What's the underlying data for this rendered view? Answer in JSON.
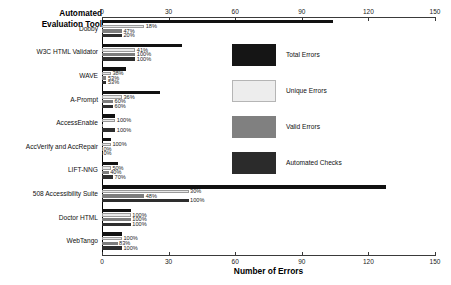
{
  "chart_data": {
    "type": "bar",
    "orientation": "horizontal",
    "title": "",
    "axis_title": "Automated Evaluation Tool",
    "xlabel": "Number of Errors",
    "ylabel": "Automated Evaluation Tool",
    "xlim": [
      0,
      150
    ],
    "xticks": [
      0,
      30,
      60,
      90,
      120,
      150
    ],
    "grid": false,
    "legend_position": "inside-right",
    "categories": [
      "Dobby",
      "W3C HTML Validator",
      "WAVE",
      "A-Prompt",
      "AccessEnable",
      "AccVerify and AccRepair",
      "LIFT-NNG",
      "508 Accessibility Suite",
      "Doctor HTML",
      "WebTango"
    ],
    "series": [
      {
        "name": "Total Errors",
        "color": "#111111",
        "values": [
          104,
          36,
          11,
          26,
          6,
          4,
          7,
          128,
          13,
          9
        ]
      },
      {
        "name": "Unique Errors",
        "color": "#e8e8e8",
        "values": [
          19,
          15,
          4,
          9,
          6,
          4,
          4,
          39,
          13,
          9
        ]
      },
      {
        "name": "Valid Errors",
        "color": "#7d7d7d",
        "values": [
          9,
          15,
          2,
          5,
          0,
          0,
          3,
          19,
          13,
          7
        ]
      },
      {
        "name": "Automated Checks",
        "color": "#2e2e2e",
        "values": [
          9,
          15,
          2,
          5,
          6,
          0,
          5,
          39,
          13,
          9
        ]
      }
    ],
    "data_labels": {
      "Dobby": [
        "18%",
        "47%",
        "20%"
      ],
      "W3C HTML Validator": [
        "41%",
        "100%",
        "100%"
      ],
      "WAVE": [
        "38%",
        "53%",
        "53%"
      ],
      "A-Prompt": [
        "36%",
        "60%",
        "60%"
      ],
      "AccessEnable": [
        "100%",
        "",
        "100%"
      ],
      "AccVerify and AccRepair": [
        "100%",
        "0%",
        "0%"
      ],
      "LIFT-NNG": [
        "50%",
        "40%",
        "70%"
      ],
      "508 Accessibility Suite": [
        "30%",
        "48%",
        "100%"
      ],
      "Doctor HTML": [
        "100%",
        "100%",
        "100%"
      ],
      "WebTango": [
        "100%",
        "83%",
        "100%"
      ]
    }
  },
  "legend": {
    "items": [
      {
        "label": "Total Errors",
        "key": "total"
      },
      {
        "label": "Unique Errors",
        "key": "unique"
      },
      {
        "label": "Valid Errors",
        "key": "valid"
      },
      {
        "label": "Automated Checks",
        "key": "checks"
      }
    ]
  },
  "axes": {
    "top_ticks": [
      "0",
      "30",
      "60",
      "90",
      "120",
      "150"
    ],
    "bottom_ticks": [
      "0",
      "30",
      "60",
      "90",
      "120",
      "150"
    ],
    "xlabel": "Number of Errors",
    "ylabel_line1": "Automated",
    "ylabel_line2": "Evaluation Tool"
  }
}
